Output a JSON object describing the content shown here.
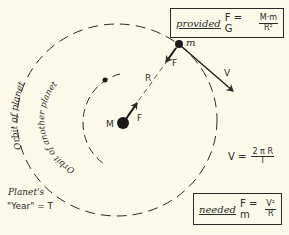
{
  "diagram": {
    "labels": {
      "central_mass": "M",
      "planet": "m",
      "force_on_planet": "F",
      "force_on_sun": "F",
      "radius": "R",
      "velocity": "V",
      "orbit_of_planet": "Orbit of planet",
      "orbit_of_another_planet": "Orbit of another planet",
      "planet_year_line1": "Planet's",
      "planet_year_line2": "\"Year\" = T"
    },
    "formulas": {
      "provided": {
        "keyword": "provided",
        "lhs": "F = G",
        "numerator": "M·m",
        "denominator": "R²"
      },
      "velocity": {
        "lhs": "V =",
        "numerator": "2 π R",
        "denominator": "T"
      },
      "needed": {
        "keyword": "needed",
        "lhs": "F = m",
        "numerator": "V²",
        "denominator": "R"
      }
    },
    "colors": {
      "background": "#fbf9e9",
      "ink": "#2a2a2a"
    }
  }
}
